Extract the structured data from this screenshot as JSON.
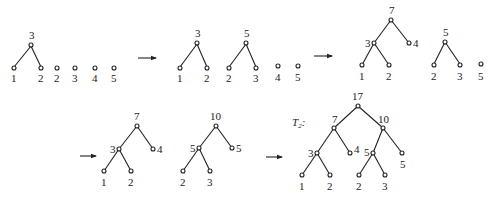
{
  "steps": [
    {
      "id": "step1",
      "forest": [
        "(1,2)->3",
        "2",
        "3",
        "4",
        "5"
      ],
      "labels": {
        "root": "3",
        "leaves": [
          "1",
          "2"
        ],
        "singles": [
          "2",
          "3",
          "4",
          "5"
        ]
      }
    },
    {
      "id": "step2",
      "forest": [
        "(1,2)->3",
        "(2,3)->5",
        "4",
        "5"
      ],
      "labels": {
        "t1_root": "3",
        "t1_leaves": [
          "1",
          "2"
        ],
        "t2_root": "5",
        "t2_leaves": [
          "2",
          "3"
        ],
        "singles": [
          "4",
          "5"
        ]
      }
    },
    {
      "id": "step3",
      "forest": [
        "((1,2)3,4)->7",
        "(2,3)->5",
        "5"
      ],
      "labels": {
        "t1_root": "7",
        "t1_mid": "3",
        "t1_right": "4",
        "t1_leaves": [
          "1",
          "2"
        ],
        "t2_root": "5",
        "t2_leaves": [
          "2",
          "3"
        ],
        "singles": [
          "5"
        ]
      }
    },
    {
      "id": "step4",
      "forest": [
        "((1,2)3,4)->7",
        "((2,3)5,5)->10"
      ],
      "labels": {
        "t1_root": "7",
        "t1_mid": "3",
        "t1_right": "4",
        "t1_leaves": [
          "1",
          "2"
        ],
        "t2_root": "10",
        "t2_mid": "5",
        "t2_right": "5",
        "t2_leaves": [
          "2",
          "3"
        ]
      }
    },
    {
      "id": "step5",
      "name": "T",
      "subscript": "2",
      "suffix": ":",
      "labels": {
        "root": "17",
        "left": "7",
        "right": "10",
        "ll": "3",
        "lr": "4",
        "rl": "5",
        "rr": "5",
        "leaves": [
          "1",
          "2",
          "2",
          "3"
        ]
      }
    }
  ],
  "arrow_glyph": "right-arrow"
}
